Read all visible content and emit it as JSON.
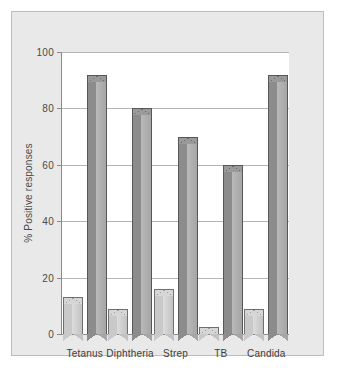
{
  "chart_data": {
    "type": "bar",
    "title": "",
    "xlabel": "",
    "ylabel": "% Positive responses",
    "ylim": [
      0,
      100
    ],
    "yticks": [
      0,
      20,
      40,
      60,
      80,
      100
    ],
    "ytick_labels": [
      "0",
      "20",
      "40",
      "60",
      "80",
      "100"
    ],
    "grid": true,
    "legend": "none",
    "categories": [
      "Tetanus",
      "Diphtheria",
      "Strep",
      "TB",
      "Candida"
    ],
    "series": [
      {
        "name": "light",
        "color": "#c9c9c9",
        "values": [
          13,
          9,
          16,
          2.5,
          9
        ]
      },
      {
        "name": "dark",
        "color": "#8c8c8c",
        "values": [
          92,
          80,
          70,
          60,
          92
        ]
      }
    ]
  },
  "figure": {
    "background": "#ffffff",
    "panel_background": "#e9e9e9",
    "panel_border": "#bdbdbd",
    "plot_background": "#ffffff",
    "gridline_color": "#b5b5b5",
    "axis_color": "#8a8a8a",
    "text_color": "#4a4a4a"
  }
}
